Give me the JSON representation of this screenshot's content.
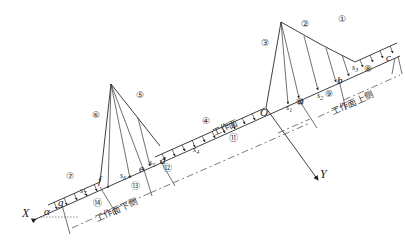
{
  "diagram": {
    "axes": {
      "x_label": "X",
      "y_label": "Y",
      "angle_label": "α",
      "origin_label": "O"
    },
    "points": {
      "a": "a",
      "b": "b",
      "c": "c",
      "d": "d",
      "e": "e",
      "f": "f",
      "g": "g"
    },
    "segments": {
      "s1": "s",
      "s1_sub": "1",
      "s2": "s",
      "s2_sub": "2",
      "s3": "s",
      "s3_sub": "3",
      "s4": "s",
      "s4_sub": "4",
      "s5": "s",
      "s5_sub": "5",
      "s6": "s",
      "s6_sub": "6",
      "s7": "s",
      "s7_sub": "7"
    },
    "zone_numbers": {
      "n1": "①",
      "n2": "②",
      "n3": "③",
      "n4": "④",
      "n5": "⑤",
      "n6": "⑥",
      "n7": "⑦",
      "n8": "⑧",
      "n9": "⑨",
      "n10": "⑩",
      "n11": "⑪",
      "n12": "⑫",
      "n13": "⑬",
      "n14": "⑭"
    },
    "text_labels": {
      "working_face": "工作面",
      "upper_side": "工作面上侧",
      "lower_side": "工作面下侧"
    }
  }
}
